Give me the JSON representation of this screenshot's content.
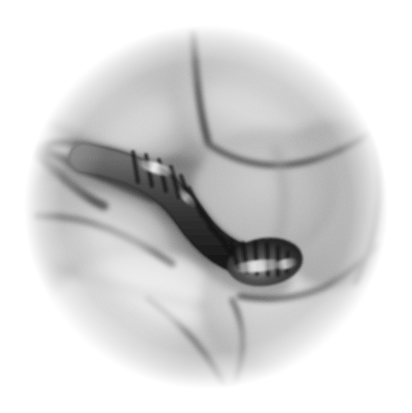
{
  "figure": {
    "kind": "endoscopic-photograph",
    "modality": "white-light endoscopy",
    "color_mode": "grayscale",
    "shape": "circular field of view",
    "background_color": "#ffffff",
    "caption": "",
    "width_px": 412,
    "height_px": 413
  },
  "field_of_view": {
    "center_x": 206,
    "center_y": 207,
    "radius_px": 176,
    "vignette": "soft white fade at periphery",
    "grain": "fine film-like noise across entire field"
  },
  "palette": {
    "white": "#ffffff",
    "highlight": "#f2f2f2",
    "mucosa_light": "#d9d9d9",
    "mucosa_mid": "#b8b8b8",
    "mucosa_shadow": "#8c8c8c",
    "fold_crease": "#5e5e5e",
    "deep_crease": "#3a3a3a",
    "worm_body": "#4a4a4a",
    "worm_dark": "#1e1e1e",
    "worm_band": "#141414",
    "specular": "#f7f7f7"
  },
  "anatomy": {
    "label": "intestinal lumen with mucosal folds",
    "folds": [
      {
        "id": "fold-upper-left",
        "name": "upper-left mucosal fold",
        "tone": "#c6c6c6",
        "cx": 120,
        "cy": 105,
        "rx": 92,
        "ry": 70,
        "rot": -18
      },
      {
        "id": "fold-upper-right",
        "name": "upper-right mucosal fold",
        "tone": "#cccccc",
        "cx": 270,
        "cy": 100,
        "rx": 100,
        "ry": 72,
        "rot": 8
      },
      {
        "id": "fold-left",
        "name": "left lateral mucosal fold",
        "tone": "#c2c2c2",
        "cx": 95,
        "cy": 235,
        "rx": 78,
        "ry": 62,
        "rot": 22
      },
      {
        "id": "fold-lower-left",
        "name": "lower-left mucosal fold",
        "tone": "#dcdcdc",
        "cx": 135,
        "cy": 320,
        "rx": 95,
        "ry": 66,
        "rot": -12
      },
      {
        "id": "fold-lower-right",
        "name": "lower-right mucosal fold",
        "tone": "#cfcfcf",
        "cx": 290,
        "cy": 310,
        "rx": 92,
        "ry": 68,
        "rot": 14
      },
      {
        "id": "fold-right",
        "name": "right lateral mucosal fold",
        "tone": "#b4b4b4",
        "cx": 330,
        "cy": 205,
        "rx": 68,
        "ry": 80,
        "rot": -6
      },
      {
        "id": "fold-central",
        "name": "central quadrangular mucosal plateau",
        "tone": "#b9b9b9",
        "cx": 265,
        "cy": 190,
        "rx": 70,
        "ry": 62,
        "rot": 0
      }
    ],
    "creases": [
      {
        "id": "crease-top-vertical",
        "name": "vertical groove between upper folds",
        "path": "M 196 34 C 198 70, 200 108, 207 140"
      },
      {
        "id": "crease-upper-right",
        "name": "arc beneath upper-right fold",
        "path": "M 210 146 C 258 172, 310 170, 366 136"
      },
      {
        "id": "crease-left-junction",
        "name": "left fold junction",
        "path": "M 36 150 C 76 166, 112 184, 150 196"
      },
      {
        "id": "crease-left-lower",
        "name": "lower-left fold margin",
        "path": "M 40 214 C 90 216, 132 238, 170 262"
      },
      {
        "id": "crease-bottom-v",
        "name": "bottom V-shaped fold convergence",
        "path": "M 150 300 C 196 336, 214 352, 232 386"
      },
      {
        "id": "crease-bottom-right",
        "name": "lower-right radiating crease",
        "path": "M 236 300 C 292 308, 330 292, 372 250"
      },
      {
        "id": "crease-right-edge",
        "name": "right peripheral crease",
        "path": "M 372 140 C 382 186, 378 232, 356 276"
      }
    ]
  },
  "parasite": {
    "label": "segmented parasitic worm in lumen",
    "common_name": "helminth / leech-like worm",
    "orientation": "enters from left, curves down and right, blunt head at lower right",
    "surface": "transverse annular bands (segmentation striations)",
    "band_count": 16,
    "body_color": "#3c3c3c",
    "band_color": "#141414",
    "specular_highlight": "#f2f2f2",
    "head": {
      "cx": 265,
      "cy": 262,
      "rx": 36,
      "ry": 23,
      "rot": -8
    },
    "centerline": "M 88 160 C 132 168, 164 182, 186 214 C 206 244, 230 262, 262 264",
    "thickness_px": 30
  },
  "annotations": []
}
